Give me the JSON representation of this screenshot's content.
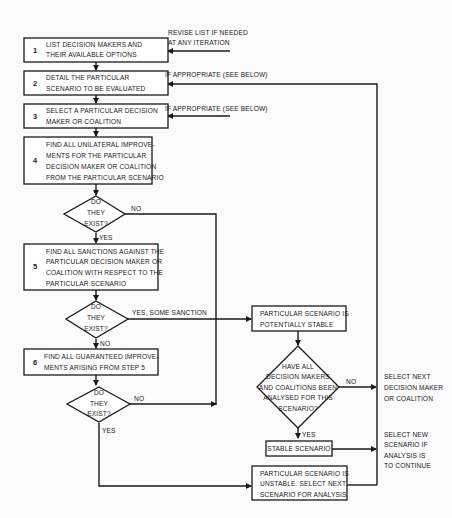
{
  "diagram": {
    "type": "flowchart",
    "steps": [
      {
        "number": "1",
        "lines": [
          "LIST DECISION MAKERS AND",
          "THEIR AVAILABLE OPTIONS"
        ]
      },
      {
        "number": "2",
        "lines": [
          "DETAIL THE PARTICULAR",
          "SCENARIO TO BE EVALUATED"
        ]
      },
      {
        "number": "3",
        "lines": [
          "SELECT A PARTICULAR DECISION",
          "MAKER OR COALITION"
        ]
      },
      {
        "number": "4",
        "lines": [
          "FIND ALL UNILATERAL IMPROVE-",
          "MENTS FOR THE PARTICULAR",
          "DECISION MAKER OR COALITION",
          "FROM THE PARTICULAR SCENARIO"
        ]
      },
      {
        "number": "5",
        "lines": [
          "FIND ALL SANCTIONS AGAINST THE",
          "PARTICULAR DECISION MAKER OR",
          "COALITION WITH RESPECT TO THE",
          "PARTICULAR SCENARIO"
        ]
      },
      {
        "number": "6",
        "lines": [
          "FIND ALL GUARANTEED IMPROVE-",
          "MENTS ARISING FROM STEP 5"
        ]
      }
    ],
    "decisions": [
      {
        "lines": [
          "DO",
          "THEY",
          "EXIST?"
        ],
        "yes_label": "YES",
        "no_label": "NO"
      },
      {
        "lines": [
          "DO",
          "THEY",
          "EXIST?"
        ],
        "yes_label": "YES, SOME SANCTION",
        "no_label": "NO"
      },
      {
        "lines": [
          "DO",
          "THEY",
          "EXIST?"
        ],
        "yes_label": "YES",
        "no_label": "NO"
      },
      {
        "lines": [
          "HAVE ALL",
          "DECISION MAKERS",
          "AND COALITIONS BEEN",
          "ANALYSED FOR THIS",
          "SCENARIO?"
        ],
        "yes_label": "YES",
        "no_label": "NO"
      }
    ],
    "outcomes": {
      "potentially_stable": [
        "PARTICULAR SCENARIO IS",
        "POTENTIALLY STABLE"
      ],
      "stable": [
        "STABLE SCENARIO"
      ],
      "unstable": [
        "PARTICULAR SCENARIO IS",
        "UNSTABLE. SELECT NEXT",
        "SCENARIO FOR ANALYSIS"
      ]
    },
    "annotations": {
      "revise_list": [
        "REVISE LIST IF NEEDED",
        "AT ANY ITERATION"
      ],
      "if_appropriate_2": "IF APPROPRIATE (SEE BELOW)",
      "if_appropriate_3": "IF APPROPRIATE (SEE BELOW)",
      "select_next_dm": [
        "SELECT NEXT",
        "DECISION MAKER",
        "OR COALITION"
      ],
      "select_new_scenario": [
        "SELECT NEW",
        "SCENARIO IF",
        "ANALYSIS IS",
        "TO CONTINUE"
      ]
    }
  }
}
